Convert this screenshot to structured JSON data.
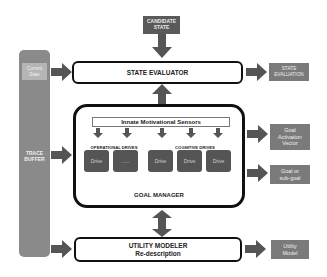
{
  "diagram": {
    "candidate_state": "CANDIDATE\nSTATE",
    "trace_buffer": "TRACE\nBUFFER",
    "current_state": "Current\nState",
    "state_evaluator": "STATE EVALUATOR",
    "state_evaluation": "STATE\nEVALUATION",
    "goal_manager": {
      "title": "GOAL MANAGER",
      "sensors": "Innate Motivational Sensors",
      "operational_label": "OPERATIONAL DRIVES",
      "cognitive_label": "COGNITIVE DRIVES",
      "operational_drives": [
        "Drive",
        "......"
      ],
      "cognitive_drives": [
        "Drive",
        "Drive",
        "Drive"
      ]
    },
    "goal_activation_vector": "Goal\nActivation\nVector",
    "goal_or_subgoal": "Goal or\nsub-goal",
    "utility_modeler": {
      "title": "UTILITY MODELER",
      "subtitle": "Re-description"
    },
    "utility_model": "Utility\nModel"
  },
  "colors": {
    "dark_box": "#5a5a5a",
    "output_box": "#7a7a7a",
    "trace_buffer": "#8a8a8a",
    "arrow": "#555555",
    "frame": "#111111"
  }
}
